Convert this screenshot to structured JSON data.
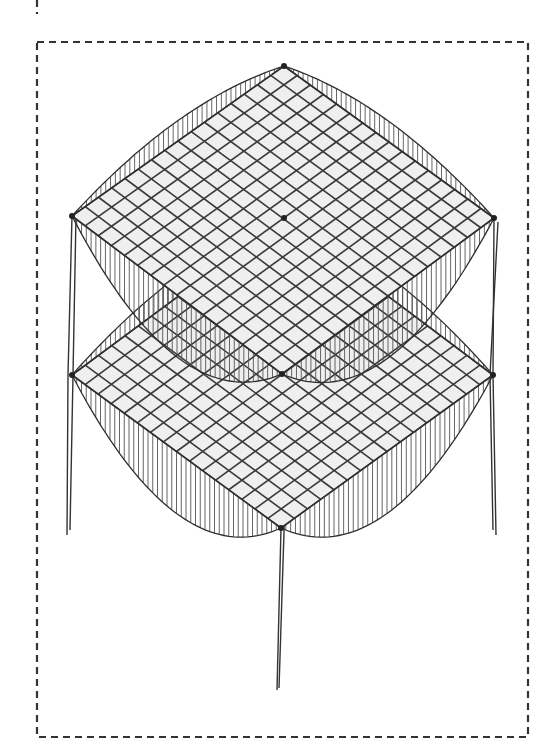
{
  "diagram": {
    "slabs": [
      {
        "name": "upper-slab",
        "level": 2
      },
      {
        "name": "lower-slab",
        "level": 1
      }
    ],
    "grid_divisions": 16,
    "columns": [
      "left-column",
      "right-column",
      "center-column"
    ],
    "colors": {
      "line": "#333333",
      "slab_fill": "#efefef",
      "background": "#ffffff"
    }
  }
}
